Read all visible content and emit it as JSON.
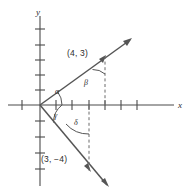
{
  "figure": {
    "background_color": "#ffffff",
    "line_color": "#555555",
    "axis_color": "#4a4a4a",
    "text_color": "#2b2b2b",
    "axes": {
      "x_axis_label": "x",
      "y_axis_label": "y",
      "x_axis_name": "horizontal-axis",
      "y_axis_name": "vertical-axis",
      "origin_px": [
        40,
        105
      ],
      "unit_px": 16.2,
      "x_tick_values": [
        -1,
        1,
        2,
        3,
        4,
        5,
        6
      ],
      "y_tick_values": [
        1,
        2,
        3,
        4,
        5,
        -1,
        -2,
        -3,
        -4
      ]
    },
    "points": [
      {
        "name": "point-4-3",
        "label": "(4, 3)",
        "x": 4,
        "y": 3,
        "label_px": [
          67,
          49
        ]
      },
      {
        "name": "point-3-minus-4",
        "label": "(3, −4)",
        "x": 3,
        "y": -4,
        "label_px": [
          41,
          155
        ]
      }
    ],
    "angles": [
      {
        "name": "angle-alpha",
        "label": "α",
        "description": "angle from positive x-axis to the upper ray",
        "label_px": [
          55,
          90
        ]
      },
      {
        "name": "angle-beta",
        "label": "β",
        "description": "angle at the point (4, 3) between the ray and the vertical dashed line",
        "label_px": [
          84,
          80
        ]
      },
      {
        "name": "angle-gamma",
        "label": "γ",
        "description": "angle from the positive x-axis down to the lower ray",
        "label_px": [
          54,
          113
        ]
      },
      {
        "name": "angle-delta",
        "label": "δ",
        "description": "angle at the point (3, −4) between the vertical dashed line and the lower ray",
        "label_px": [
          74,
          120
        ]
      }
    ],
    "rays": [
      {
        "name": "ray-upper-right",
        "through_point": "(4, 3)",
        "from_px": [
          40,
          105
        ],
        "to_px": [
          130,
          40
        ]
      },
      {
        "name": "ray-lower-right",
        "through_point": "(3, −4)",
        "from_px": [
          40,
          105
        ],
        "to_px": [
          107,
          185
        ]
      }
    ],
    "dashed_segments": [
      {
        "name": "dashed-drop-from-4-3",
        "from_px": [
          105,
          56
        ],
        "to_px": [
          105,
          105
        ]
      },
      {
        "name": "dashed-drop-to-3-minus-4",
        "from_px": [
          89,
          105
        ],
        "to_px": [
          89,
          170
        ]
      }
    ]
  }
}
